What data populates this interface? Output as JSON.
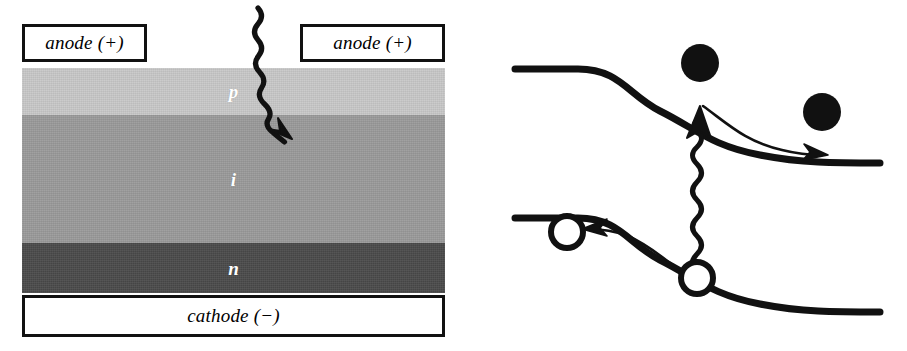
{
  "figure": {
    "panels": [
      "device-cross-section",
      "energy-band-diagram"
    ]
  },
  "device": {
    "electrodes": [
      {
        "id": "anode-left",
        "label": "anode (+)",
        "polarity": "+"
      },
      {
        "id": "anode-right",
        "label": "anode (+)",
        "polarity": "+"
      },
      {
        "id": "cathode",
        "label": "cathode (−)",
        "polarity": "−"
      }
    ],
    "layers": [
      {
        "id": "p",
        "label": "p",
        "color": "#c9c9c9",
        "top": 68,
        "height": 47,
        "name": "p-type layer"
      },
      {
        "id": "i",
        "label": "i",
        "color": "#9b9b9b",
        "top": 115,
        "height": 128,
        "name": "intrinsic layer"
      },
      {
        "id": "n",
        "label": "n",
        "color": "#4b4b4b",
        "top": 243,
        "height": 50,
        "name": "n-type layer"
      }
    ],
    "photon": {
      "name": "incident-photon",
      "description": "wavy arrow entering through the p layer into the i layer",
      "direction": "down-right"
    }
  },
  "band_diagram": {
    "conduction_band": {
      "name": "conduction-band",
      "left_level": 69,
      "right_level": 163,
      "shape": "step-down S-curve across the junction"
    },
    "valence_band": {
      "name": "valence-band",
      "left_level": 218,
      "right_level": 312,
      "shape": "step-down S-curve across the junction"
    },
    "photon": {
      "name": "absorbed-photon",
      "description": "vertical wavy arrow from valence band up to conduction band",
      "direction": "up"
    },
    "carriers": [
      {
        "id": "electron-generated",
        "type": "electron",
        "fill": "solid",
        "band": "conduction",
        "x": 700,
        "y": 103
      },
      {
        "id": "electron-drifted",
        "type": "electron",
        "fill": "solid",
        "band": "conduction",
        "x": 822,
        "y": 152
      },
      {
        "id": "hole-generated",
        "type": "hole",
        "fill": "hollow",
        "band": "valence",
        "x": 697,
        "y": 278
      },
      {
        "id": "hole-drifted",
        "type": "hole",
        "fill": "hollow",
        "band": "valence",
        "x": 567,
        "y": 232
      }
    ],
    "carrier_arrows": [
      {
        "id": "electron-drift-arrow",
        "direction": "right",
        "band": "conduction"
      },
      {
        "id": "hole-drift-arrow",
        "direction": "left",
        "band": "valence"
      }
    ]
  },
  "colors": {
    "ink": "#111111",
    "paper": "#ffffff",
    "layer_p": "#c9c9c9",
    "layer_i": "#9b9b9b",
    "layer_n": "#4b4b4b",
    "label_text": "#ffffff"
  }
}
